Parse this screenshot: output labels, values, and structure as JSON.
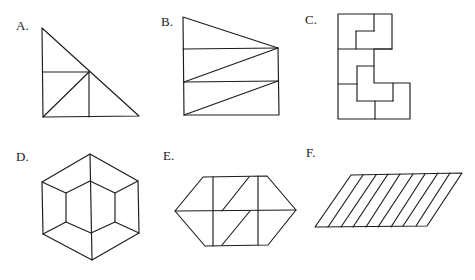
{
  "figures": [
    {
      "id": "A",
      "label": "A.",
      "label_pos": [
        16,
        19
      ],
      "description": "right triangle subdivided into a square split by a diagonal and two triangles",
      "polygons": [
        [
          [
            42,
            28
          ],
          [
            43,
            117
          ],
          [
            139,
            116
          ]
        ]
      ],
      "lines": [
        [
          43,
          72,
          89,
          72
        ],
        [
          89,
          72,
          89,
          117
        ],
        [
          43,
          117,
          89,
          72
        ]
      ]
    },
    {
      "id": "B",
      "label": "B.",
      "label_pos": [
        161,
        15
      ],
      "description": "trapezoid divided into one top triangle and two rectangles each split by a diagonal",
      "polygons": [
        [
          [
            183,
            17
          ],
          [
            278,
            48
          ],
          [
            279,
            115
          ],
          [
            184,
            115
          ]
        ]
      ],
      "lines": [
        [
          183,
          49,
          278,
          48
        ],
        [
          184,
          82,
          278,
          81
        ],
        [
          184,
          82,
          278,
          48
        ],
        [
          184,
          115,
          278,
          81
        ]
      ]
    },
    {
      "id": "C",
      "label": "C.",
      "label_pos": [
        305,
        13
      ],
      "description": "polyomino-like shape composed of interlocking L-shaped pieces",
      "polygons": [
        [
          [
            338,
            14
          ],
          [
            392,
            14
          ],
          [
            392,
            49
          ],
          [
            374,
            49
          ],
          [
            374,
            83
          ],
          [
            410,
            83
          ],
          [
            410,
            119
          ],
          [
            338,
            119
          ]
        ]
      ],
      "lines": [
        [
          374,
          14,
          374,
          31
        ],
        [
          356,
          31,
          374,
          31
        ],
        [
          356,
          31,
          356,
          49
        ],
        [
          338,
          49,
          392,
          49
        ],
        [
          357,
          66,
          374,
          66
        ],
        [
          357,
          66,
          357,
          101
        ],
        [
          357,
          101,
          393,
          101
        ],
        [
          393,
          83,
          393,
          101
        ],
        [
          338,
          84,
          357,
          84
        ],
        [
          375,
          101,
          375,
          119
        ]
      ]
    },
    {
      "id": "D",
      "label": "D.",
      "label_pos": [
        16,
        150
      ],
      "description": "hexagon with inner hexagon and connecting spokes plus central vertical line",
      "polygons": [
        [
          [
            90,
            154
          ],
          [
            138,
            181
          ],
          [
            139,
            233
          ],
          [
            92,
            260
          ],
          [
            43,
            234
          ],
          [
            42,
            182
          ]
        ],
        [
          [
            90,
            181
          ],
          [
            115,
            193
          ],
          [
            115,
            222
          ],
          [
            91,
            233
          ],
          [
            66,
            222
          ],
          [
            66,
            193
          ]
        ]
      ],
      "lines": [
        [
          90,
          154,
          92,
          260
        ],
        [
          138,
          181,
          115,
          193
        ],
        [
          139,
          233,
          115,
          222
        ],
        [
          43,
          234,
          66,
          222
        ],
        [
          42,
          182,
          66,
          193
        ]
      ]
    },
    {
      "id": "E",
      "label": "E.",
      "label_pos": [
        163,
        149
      ],
      "description": "elongated hexagon split by a horizontal midline, two verticals and two diagonals",
      "polygons": [
        [
          [
            175,
            211
          ],
          [
            203,
            177
          ],
          [
            267,
            176
          ],
          [
            296,
            210
          ],
          [
            268,
            245
          ],
          [
            205,
            246
          ]
        ]
      ],
      "lines": [
        [
          175,
          211,
          296,
          210
        ],
        [
          213,
          177,
          213,
          246
        ],
        [
          258,
          176,
          258,
          245
        ],
        [
          249,
          177,
          222,
          211
        ],
        [
          250,
          211,
          222,
          245
        ]
      ]
    },
    {
      "id": "F",
      "label": "F.",
      "label_pos": [
        306,
        146
      ],
      "description": "parallelogram divided into nine slanted strips",
      "polygons": [
        [
          [
            351,
            175
          ],
          [
            462,
            173
          ],
          [
            427,
            226
          ],
          [
            315,
            227
          ]
        ]
      ],
      "lines": [
        [
          363,
          175,
          328,
          227
        ],
        [
          376,
          175,
          341,
          227
        ],
        [
          388,
          174,
          353,
          227
        ],
        [
          400,
          174,
          366,
          227
        ],
        [
          413,
          174,
          378,
          227
        ],
        [
          425,
          174,
          391,
          227
        ],
        [
          438,
          173,
          403,
          226
        ],
        [
          450,
          173,
          416,
          226
        ]
      ]
    }
  ],
  "colors": {
    "stroke": "#1c1c1c",
    "background": "#ffffff"
  }
}
